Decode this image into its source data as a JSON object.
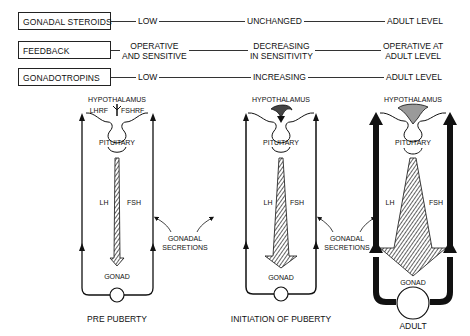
{
  "table": {
    "rows": [
      {
        "label": "GONADAL STEROIDS",
        "pre": "LOW",
        "initiation": "UNCHANGED",
        "adult": "ADULT LEVEL"
      },
      {
        "label": "FEEDBACK",
        "pre_line1": "OPERATIVE",
        "pre_line2": "AND SENSITIVE",
        "initiation_line1": "DECREASING",
        "initiation_line2": "IN SENSITIVITY",
        "adult_line1": "OPERATIVE AT",
        "adult_line2": "ADULT LEVEL"
      },
      {
        "label": "GONADOTROPINS",
        "pre": "LOW",
        "initiation": "INCREASING",
        "adult": "ADULT LEVEL"
      }
    ]
  },
  "diagrams": [
    {
      "stage": "PRE PUBERTY",
      "hypothalamus": "HYPOTHALAMUS",
      "lhrf": "LHRF",
      "fshrf": "FSHRF",
      "pituitary": "PITUITARY",
      "lh": "LH",
      "fsh": "FSH",
      "gonad": "GONAD"
    },
    {
      "stage": "INITIATION OF PUBERTY",
      "hypothalamus": "HYPOTHALAMUS",
      "pituitary": "PITUITARY",
      "lh": "LH",
      "fsh": "FSH",
      "gonad": "GONAD"
    },
    {
      "stage": "ADULT",
      "hypothalamus": "HYPOTHALAMUS",
      "pituitary": "PITUITARY",
      "lh": "LH",
      "fsh": "FSH",
      "gonad": "GONAD"
    }
  ],
  "annotations": {
    "gonadal_secretions_1_line1": "GONADAL",
    "gonadal_secretions_1_line2": "SECRETIONS",
    "gonadal_secretions_2_line1": "GONADAL",
    "gonadal_secretions_2_line2": "SECRETIONS"
  }
}
